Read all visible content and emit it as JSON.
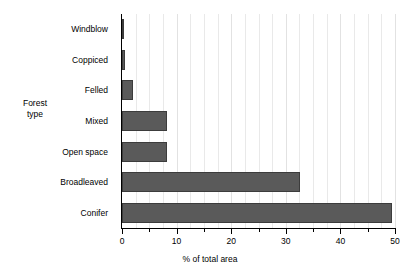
{
  "chart_data": {
    "type": "bar",
    "orientation": "horizontal",
    "title": "",
    "xlabel": "% of total area",
    "ylabel": "Forest type",
    "categories": [
      "Windblow",
      "Coppiced",
      "Felled",
      "Mixed",
      "Open space",
      "Broadleaved",
      "Conifer"
    ],
    "values": [
      0.2,
      0.5,
      2.0,
      8.2,
      8.2,
      32.6,
      49.5
    ],
    "xlim": [
      0,
      50
    ],
    "xticks": [
      0,
      10,
      20,
      30,
      40,
      50
    ],
    "xtick_labels": [
      "0",
      "10",
      "20",
      "30",
      "40",
      "50"
    ],
    "minor_xticks": [
      5,
      15,
      25,
      35,
      45
    ],
    "gridlines": [
      2.5,
      5,
      7.5,
      10,
      12.5,
      15,
      17.5,
      20,
      22.5,
      25,
      27.5,
      30,
      32.5,
      35,
      37.5,
      40,
      42.5,
      45,
      47.5,
      50
    ],
    "grid": true,
    "legend": null,
    "bar_color": "#5a5a5a",
    "bar_edge_color": "#3c3c3c",
    "axis_color": "#000000",
    "grid_color": "#e9e9e9"
  },
  "ylabel_lines": [
    "Forest",
    "type"
  ]
}
